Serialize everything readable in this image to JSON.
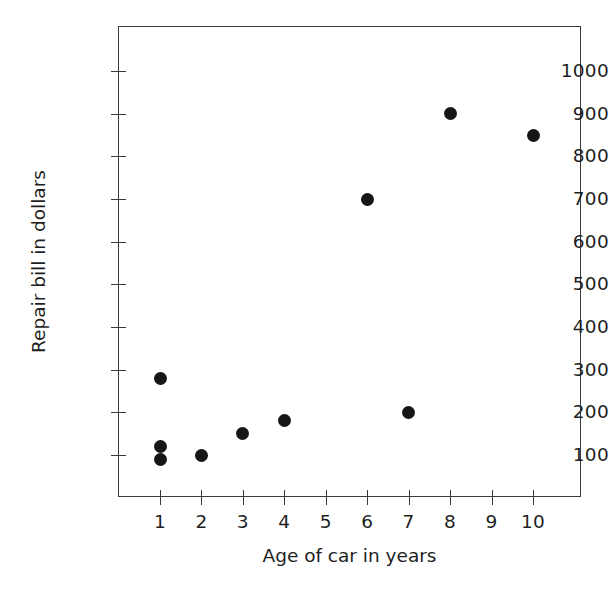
{
  "chart_data": {
    "type": "scatter",
    "title": "",
    "xlabel": "Age of car in years",
    "ylabel": "Repair bill in dollars",
    "xlim": [
      0,
      11
    ],
    "ylim": [
      0,
      1100
    ],
    "grid": false,
    "legend": null,
    "x_ticks": [
      1,
      2,
      3,
      4,
      5,
      6,
      7,
      8,
      9,
      10
    ],
    "x_tick_labels": [
      "1",
      "2",
      "3",
      "4",
      "5",
      "6",
      "7",
      "8",
      "9",
      "10"
    ],
    "y_ticks": [
      100,
      200,
      300,
      400,
      500,
      600,
      700,
      800,
      900,
      1000
    ],
    "y_tick_labels": [
      "100",
      "200",
      "300",
      "400",
      "500",
      "600",
      "700",
      "800",
      "900",
      "1000"
    ],
    "marker_color": "#161616",
    "points": [
      {
        "x": 1,
        "y": 280
      },
      {
        "x": 1,
        "y": 120
      },
      {
        "x": 1,
        "y": 90
      },
      {
        "x": 2,
        "y": 100
      },
      {
        "x": 3,
        "y": 150
      },
      {
        "x": 4,
        "y": 180
      },
      {
        "x": 6,
        "y": 700
      },
      {
        "x": 7,
        "y": 200
      },
      {
        "x": 8,
        "y": 900
      },
      {
        "x": 10,
        "y": 850
      }
    ]
  }
}
